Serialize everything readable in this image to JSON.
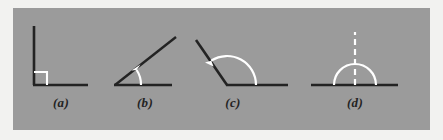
{
  "figure": {
    "panel": {
      "background_color": "#9b9b9b",
      "outer_background_color": "#f2f2f0",
      "x": 13,
      "y": 8,
      "width": 417,
      "height": 122
    },
    "stroke_colors": {
      "ray": "#232323",
      "marker": "#ffffff",
      "label": "#232323"
    },
    "panels": [
      {
        "key": "a",
        "label": "(a)",
        "angle_name": "right angle",
        "angle_degrees": 90,
        "marker_type": "square",
        "vertex": {
          "x": 34,
          "y": 85
        },
        "rays": [
          {
            "name": "vertical-ray",
            "to_x": 34,
            "to_y": 26
          },
          {
            "name": "horizontal-ray",
            "to_x": 88,
            "to_y": 85
          }
        ],
        "marker": {
          "size": 12
        }
      },
      {
        "key": "b",
        "label": "(b)",
        "angle_name": "acute angle",
        "angle_degrees": 38,
        "marker_type": "arc-arrow",
        "vertex": {
          "x": 115,
          "y": 85
        },
        "rays": [
          {
            "name": "slanted-ray",
            "to_x": 176,
            "to_y": 37
          },
          {
            "name": "horizontal-ray",
            "to_x": 172,
            "to_y": 85
          }
        ],
        "marker": {
          "radius": 26,
          "start_deg": 0,
          "end_deg": 38,
          "arrow_at": "end"
        }
      },
      {
        "key": "c",
        "label": "(c)",
        "angle_name": "obtuse angle",
        "angle_degrees": 124,
        "marker_type": "arc-arrow",
        "vertex": {
          "x": 227,
          "y": 85
        },
        "rays": [
          {
            "name": "slanted-ray",
            "to_x": 196,
            "to_y": 40
          },
          {
            "name": "horizontal-ray",
            "to_x": 288,
            "to_y": 85
          }
        ],
        "marker": {
          "radius": 29,
          "start_deg": 0,
          "end_deg": 124,
          "arrow_at": "end"
        }
      },
      {
        "key": "d",
        "label": "(d)",
        "angle_name": "straight angle",
        "angle_degrees": 180,
        "marker_type": "semicircle-dashed",
        "vertex": {
          "x": 355,
          "y": 85
        },
        "rays": [
          {
            "name": "left-ray",
            "to_x": 311,
            "to_y": 85
          },
          {
            "name": "right-ray",
            "to_x": 398,
            "to_y": 85
          }
        ],
        "marker": {
          "radius": 21,
          "dashed_line_top_y": 32
        }
      }
    ]
  }
}
